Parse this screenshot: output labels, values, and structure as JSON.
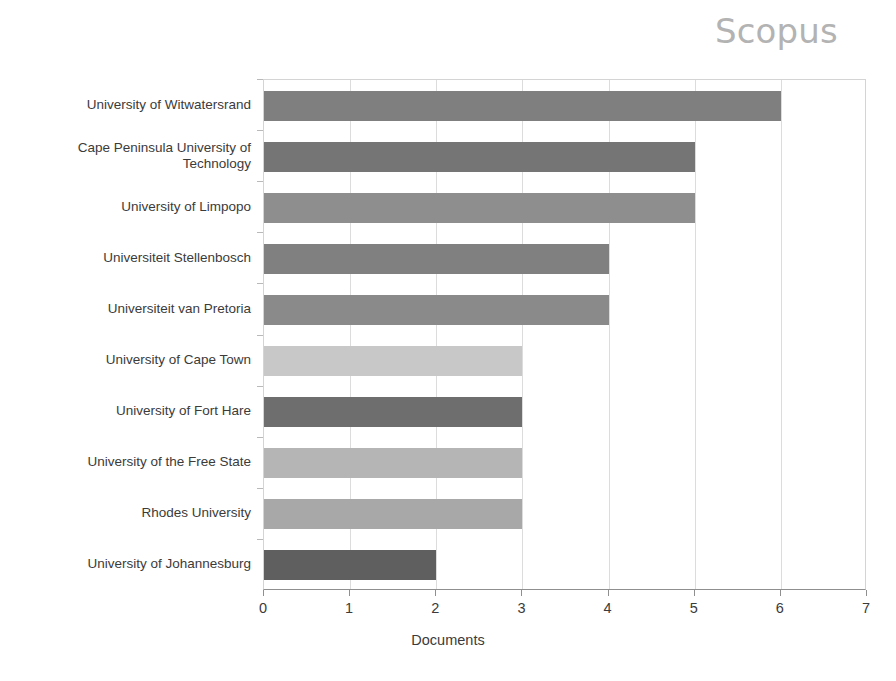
{
  "brand": {
    "label": "Scopus"
  },
  "chart_data": {
    "type": "bar",
    "orientation": "horizontal",
    "title": "",
    "subtitle": "",
    "xlabel": "Documents",
    "ylabel": "",
    "xlim": [
      0,
      7
    ],
    "xticks": [
      0,
      1,
      2,
      3,
      4,
      5,
      6,
      7
    ],
    "xtick_labels": [
      "0",
      "1",
      "2",
      "3",
      "4",
      "5",
      "6",
      "7"
    ],
    "grid": true,
    "grid_axis": "x",
    "legend": false,
    "legend_position": "none",
    "categories": [
      "University of Witwatersrand",
      "Cape Peninsula University of\nTechnology",
      "University of Limpopo",
      "Universiteit Stellenbosch",
      "Universiteit van Pretoria",
      "University of Cape Town",
      "University of Fort Hare",
      "University of the Free State",
      "Rhodes University",
      "University of Johannesburg"
    ],
    "values": [
      6,
      5,
      5,
      4,
      4,
      3,
      3,
      3,
      3,
      2
    ],
    "bar_colors": [
      "#7f7f7f",
      "#757575",
      "#8e8e8e",
      "#808080",
      "#8a8a8a",
      "#c8c8c8",
      "#6e6e6e",
      "#b5b5b5",
      "#a8a8a8",
      "#5f5f5f"
    ]
  },
  "colors": {
    "background": "#ffffff",
    "brand_gray": "#b3b3b3",
    "gridline": "#dcdcdc",
    "axis": "#8f8f8f",
    "text": "#3b3b3b"
  }
}
